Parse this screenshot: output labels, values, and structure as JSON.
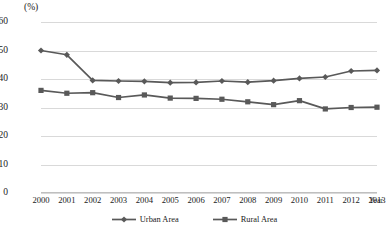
{
  "chart_data": {
    "type": "line",
    "title": "",
    "units_label": "(%)",
    "xlabel": "Year",
    "ylabel": "",
    "grid": true,
    "legend_position": "bottom",
    "ylim": [
      0,
      60
    ],
    "yticks": [
      60,
      50,
      40,
      30,
      20,
      10,
      0
    ],
    "categories": [
      "2000",
      "2001",
      "2002",
      "2003",
      "2004",
      "2005",
      "2006",
      "2007",
      "2008",
      "2009",
      "2010",
      "2011",
      "2012",
      "2013"
    ],
    "series": [
      {
        "name": "Urban Area",
        "marker": "diamond",
        "color": "#595959",
        "values": [
          50.0,
          48.5,
          39.5,
          39.3,
          39.2,
          38.7,
          38.8,
          39.3,
          38.9,
          39.4,
          40.2,
          40.7,
          42.8,
          43.0
        ]
      },
      {
        "name": "Rural Area",
        "marker": "square",
        "color": "#595959",
        "values": [
          36.0,
          35.0,
          35.2,
          33.5,
          34.4,
          33.3,
          33.2,
          32.9,
          32.0,
          31.0,
          32.4,
          29.5,
          30.0,
          30.1
        ]
      }
    ]
  },
  "colors": {
    "line": "#595959",
    "grid": "#d9d9d9",
    "axis": "#bfbfbf",
    "text": "#1a1a1a",
    "background": "#ffffff"
  }
}
